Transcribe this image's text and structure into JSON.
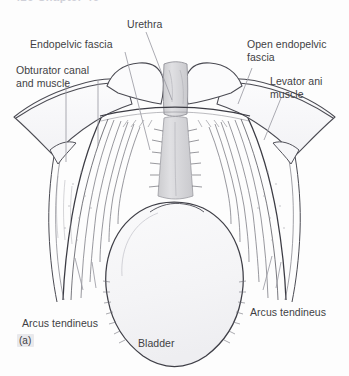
{
  "figure": {
    "running_head": "426   Chapter 46",
    "marker": "(a)",
    "background_color": "#fdfdfd",
    "ink_color": "#3f3f44",
    "line_color": "#4a4a52",
    "urethra_fill": "#d8d8dc",
    "bladder_fill": "#f6f6f8"
  },
  "labels": {
    "urethra": "Urethra",
    "endopelvic_fascia": "Endopelvic fascia",
    "obturator": "Obturator canal\nand muscle",
    "open_endopelvic_fascia": "Open endopelvic\nfascia",
    "levator_ani": "Levator ani\nmuscle",
    "arcus_tendineus_left": "Arcus tendineus",
    "arcus_tendineus_right": "Arcus tendineus",
    "bladder": "Bladder"
  }
}
